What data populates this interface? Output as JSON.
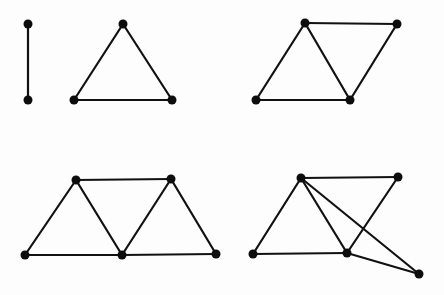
{
  "figure": {
    "colors": {
      "edge": "#111111",
      "vertex": "#0d0d0d",
      "background": "#fdfdfd"
    },
    "vertex_radius": 4.5
  },
  "graphs": [
    {
      "id": "graph-1-edge",
      "vertices": [
        [
          28,
          24
        ],
        [
          28,
          100
        ]
      ],
      "edges": [
        [
          0,
          1
        ]
      ]
    },
    {
      "id": "graph-2-triangle",
      "vertices": [
        [
          123,
          24
        ],
        [
          74,
          100
        ],
        [
          172,
          100
        ]
      ],
      "edges": [
        [
          0,
          1
        ],
        [
          0,
          2
        ],
        [
          1,
          2
        ]
      ]
    },
    {
      "id": "graph-3-rhombus",
      "vertices": [
        [
          305,
          23
        ],
        [
          397,
          24
        ],
        [
          256,
          100
        ],
        [
          350,
          100
        ]
      ],
      "edges": [
        [
          0,
          1
        ],
        [
          0,
          2
        ],
        [
          0,
          3
        ],
        [
          1,
          3
        ],
        [
          2,
          3
        ]
      ]
    },
    {
      "id": "graph-4-three-triangle-strip",
      "vertices": [
        [
          76,
          180
        ],
        [
          171,
          179
        ],
        [
          25,
          255
        ],
        [
          122,
          255
        ],
        [
          216,
          254
        ]
      ],
      "edges": [
        [
          0,
          1
        ],
        [
          0,
          2
        ],
        [
          0,
          3
        ],
        [
          1,
          3
        ],
        [
          1,
          4
        ],
        [
          2,
          3
        ],
        [
          3,
          4
        ]
      ]
    },
    {
      "id": "graph-5-rhombus-plus-vertex",
      "vertices": [
        [
          301,
          178
        ],
        [
          398,
          177
        ],
        [
          253,
          254
        ],
        [
          347,
          253
        ],
        [
          419,
          274
        ]
      ],
      "edges": [
        [
          0,
          1
        ],
        [
          0,
          2
        ],
        [
          0,
          3
        ],
        [
          0,
          4
        ],
        [
          1,
          3
        ],
        [
          2,
          3
        ],
        [
          3,
          4
        ]
      ]
    }
  ]
}
